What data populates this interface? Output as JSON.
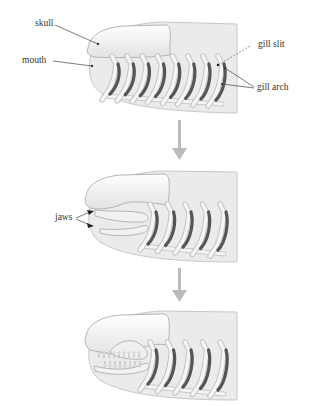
{
  "diagram": {
    "stages": [
      {
        "id": "jawless",
        "labels": {
          "skull": "skull",
          "mouth": "mouth",
          "gill_slit": "gill slit",
          "gill_arch": "gill arch"
        },
        "gill_arch_count": 8
      },
      {
        "id": "early-jaws",
        "labels": {
          "jaws": "jaws"
        },
        "gill_arch_count": 5
      },
      {
        "id": "toothed-jaws",
        "labels": {},
        "gill_arch_count": 5
      }
    ],
    "colors": {
      "body": "#e9e9e9",
      "skull": "#f3f3f3",
      "outline": "#bdbdbd",
      "gill_slit": "#555555",
      "arrow": "#b9b9b9",
      "label": "#333333"
    }
  }
}
